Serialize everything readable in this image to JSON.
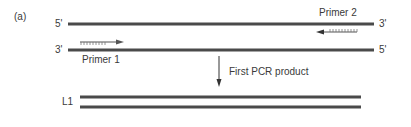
{
  "panel_label": "(a)",
  "template": {
    "top_strand": {
      "left_end": "5'",
      "right_end": "3'"
    },
    "bottom_strand": {
      "left_end": "3'",
      "right_end": "5'"
    }
  },
  "primers": [
    {
      "label": "Primer 1",
      "direction": "right",
      "anneals_to": "bottom-strand"
    },
    {
      "label": "Primer 2",
      "direction": "left",
      "anneals_to": "top-strand"
    }
  ],
  "step": {
    "label": "First PCR product"
  },
  "product": {
    "label": "L1"
  },
  "colors": {
    "strand": "#4a4a4a",
    "arrow": "#333333",
    "text": "#3a3a3a",
    "background": "#ffffff"
  }
}
